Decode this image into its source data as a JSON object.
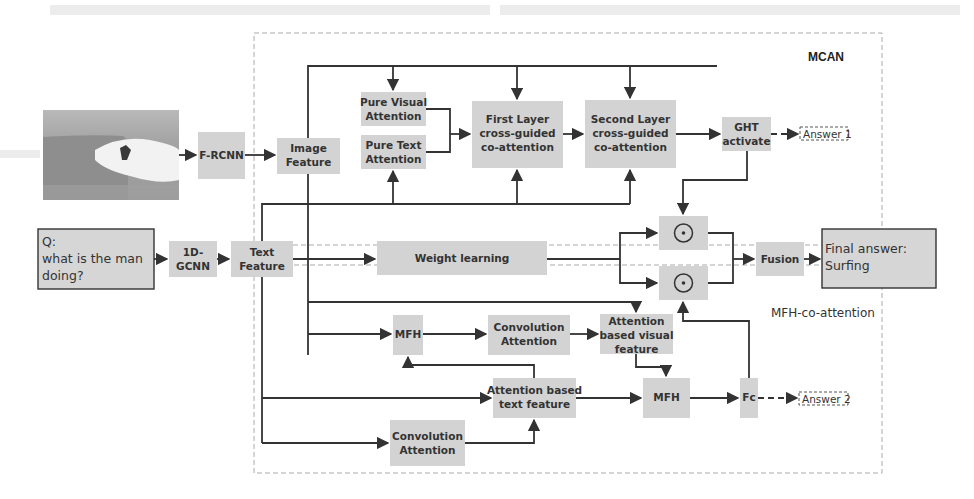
{
  "groups": {
    "mcan": "MCAN",
    "mfh": "MFH-co-attention"
  },
  "inputs": {
    "image_alt": "surfer-photo",
    "question_l1": "Q:",
    "question_l2": "what is the man",
    "question_l3": "doing?"
  },
  "nodes": {
    "frcnn": "F-RCNN",
    "gcnn_l1": "1D-",
    "gcnn_l2": "GCNN",
    "image_feature_l1": "Image",
    "image_feature_l2": "Feature",
    "text_feature_l1": "Text",
    "text_feature_l2": "Feature",
    "pure_visual_l1": "Pure Visual",
    "pure_visual_l2": "Attention",
    "pure_text_l1": "Pure Text",
    "pure_text_l2": "Attention",
    "first_layer_l1": "First Layer",
    "first_layer_l2": "cross-guided",
    "first_layer_l3": "co-attention",
    "second_layer_l1": "Second Layer",
    "second_layer_l2": "cross-guided",
    "second_layer_l3": "co-attention",
    "ght_l1": "GHT",
    "ght_l2": "activate",
    "weight_learning": "Weight learning",
    "fusion": "Fusion",
    "mfh_top": "MFH",
    "conv_att_top_l1": "Convolution",
    "conv_att_top_l2": "Attention",
    "att_visual_l1": "Attention",
    "att_visual_l2": "based visual",
    "att_visual_l3": "feature",
    "att_text_l1": "Attention based",
    "att_text_l2": "text feature",
    "mfh_bottom": "MFH",
    "fc": "Fc",
    "conv_att_bottom_l1": "Convolution",
    "conv_att_bottom_l2": "Attention"
  },
  "outputs": {
    "answer1": "Answer 1",
    "answer2": "Answer 2",
    "final_l1": "Final answer:",
    "final_l2": "Surfing"
  },
  "operators": {
    "hadamard": "⊙"
  }
}
